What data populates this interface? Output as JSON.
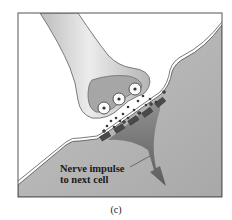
{
  "diagram": {
    "labels": {
      "callout_line1": "Nerve impulse",
      "callout_line2": "to next cell"
    },
    "caption": "(c)",
    "parts": [
      "axon-terminal",
      "synaptic-vesicles",
      "neurotransmitter-molecules",
      "synaptic-cleft",
      "receptors",
      "postsynaptic-cell",
      "impulse-arrow"
    ],
    "colors": {
      "background": "#ffffff",
      "frame": "#555555",
      "axon_fill": "#d9d9d9",
      "terminal_inner": "#a9a9a9",
      "postsynaptic_fill": "#b8b8b8",
      "arrow_fill": "#6e6e6e",
      "receptor_fill": "#4a4a4a",
      "molecule_fill": "#3a3a3a"
    }
  }
}
